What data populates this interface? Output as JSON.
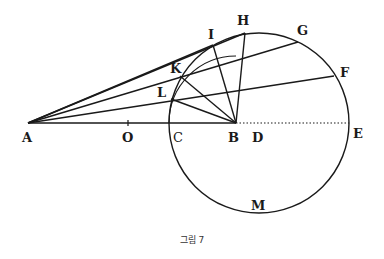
{
  "figure": {
    "caption": "그림 7",
    "points": {
      "A": "A",
      "O": "O",
      "C": "C",
      "B": "B",
      "D": "D",
      "E": "E",
      "F": "F",
      "G": "G",
      "H": "H",
      "I": "I",
      "K": "K",
      "L": "L",
      "M": "M"
    },
    "circle": {
      "center": [
        259,
        123
      ],
      "radius": 90
    },
    "line_color": "#1a1a1a"
  }
}
